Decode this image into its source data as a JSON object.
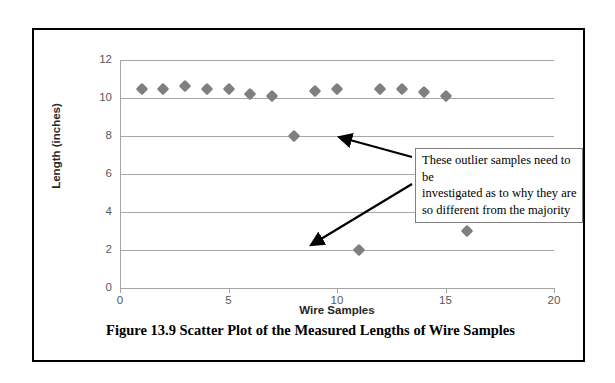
{
  "figure": {
    "caption": "Figure 13.9  Scatter Plot of the Measured Lengths of Wire Samples"
  },
  "annotation": {
    "line1": "These outlier samples need to be",
    "line2": "investigated as to why they are",
    "line3": "so different from the majority"
  },
  "colors": {
    "marker": "#7f7f7f",
    "gridline": "#a6a6a6",
    "axis_text": "#595959",
    "frame": "#000000",
    "annotation_border": "#808080"
  },
  "chart_data": {
    "type": "scatter",
    "title": "",
    "xlabel": "Wire Samples",
    "ylabel": "Length (inches)",
    "xlim": [
      0,
      20
    ],
    "ylim": [
      0,
      12
    ],
    "xticks": [
      0,
      5,
      10,
      15,
      20
    ],
    "yticks": [
      0,
      2,
      4,
      6,
      8,
      10,
      12
    ],
    "xtick_labels": [
      "0",
      "5",
      "10",
      "15",
      "20"
    ],
    "ytick_labels": [
      "0",
      "2",
      "4",
      "6",
      "8",
      "10",
      "12"
    ],
    "grid": "horizontal",
    "legend": "none",
    "series": [
      {
        "name": "Measured Length",
        "marker": "diamond",
        "color": "#7f7f7f",
        "points": [
          {
            "x": 1,
            "y": 10.5
          },
          {
            "x": 2,
            "y": 10.45
          },
          {
            "x": 3,
            "y": 10.65
          },
          {
            "x": 4,
            "y": 10.5
          },
          {
            "x": 5,
            "y": 10.5
          },
          {
            "x": 6,
            "y": 10.2
          },
          {
            "x": 7,
            "y": 10.1
          },
          {
            "x": 8,
            "y": 8.0
          },
          {
            "x": 9,
            "y": 10.35
          },
          {
            "x": 10,
            "y": 10.5
          },
          {
            "x": 11,
            "y": 2.0
          },
          {
            "x": 12,
            "y": 10.5
          },
          {
            "x": 13,
            "y": 10.45
          },
          {
            "x": 14,
            "y": 10.3
          },
          {
            "x": 15,
            "y": 10.1
          },
          {
            "x": 16,
            "y": 3.0
          }
        ]
      }
    ],
    "annotations": [
      {
        "text": "These outlier samples need to be investigated as to why they are so different from the majority",
        "points_to": [
          {
            "x": 8,
            "y": 8.0
          },
          {
            "x": 11,
            "y": 2.0
          },
          {
            "x": 16,
            "y": 3.0
          }
        ]
      }
    ]
  }
}
